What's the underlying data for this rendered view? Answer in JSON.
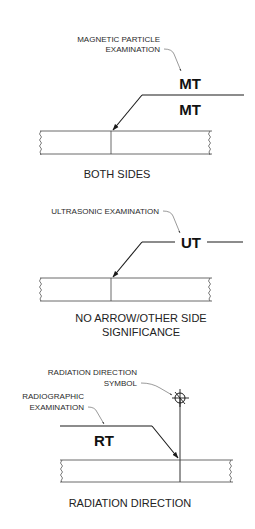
{
  "panels": [
    {
      "id": "both-sides",
      "callout": [
        "MAGNETIC PARTICLE",
        "EXAMINATION"
      ],
      "arrow_side_symbol": "MT",
      "other_side_symbol": "MT",
      "caption": [
        "BOTH SIDES"
      ]
    },
    {
      "id": "no-arrow-other-side",
      "callout": [
        "ULTRASONIC EXAMINATION"
      ],
      "symbol": "UT",
      "caption": [
        "NO ARROW/OTHER SIDE",
        "SIGNIFICANCE"
      ]
    },
    {
      "id": "radiation-direction",
      "callout_symbol": [
        "RADIATION DIRECTION",
        "SYMBOL"
      ],
      "callout_method": [
        "RADIOGRAPHIC",
        "EXAMINATION"
      ],
      "symbol": "RT",
      "caption": [
        "RADIATION DIRECTION"
      ]
    }
  ],
  "colors": {
    "line": "#1a1a1a",
    "leader": "#555555",
    "background": "#ffffff"
  }
}
